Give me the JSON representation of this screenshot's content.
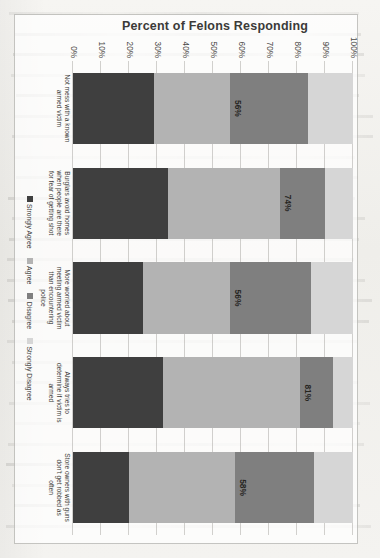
{
  "page": {
    "background_note": "scanned book page, chart rotated 90 degrees",
    "ghost_text_rows": 26
  },
  "chart_data": {
    "type": "bar",
    "subtype": "stacked-bar-100",
    "orientation": "vertical-in-chart-space-rotated-90",
    "title": "",
    "xlabel": "",
    "ylabel": "Percent of Felons Responding",
    "ylim": [
      0,
      100
    ],
    "ytick_values": [
      0,
      10,
      20,
      30,
      40,
      50,
      60,
      70,
      80,
      90,
      100
    ],
    "ytick_labels": [
      "0%",
      "10%",
      "20%",
      "30%",
      "40%",
      "50%",
      "60%",
      "70%",
      "80%",
      "90%",
      "100%"
    ],
    "grid": true,
    "legend_position": "bottom",
    "categories": [
      "Not mess with a known armed victim",
      "Burglars avoid homes when people are there for fear of getting shot",
      "More worried about meeting armed victim than encountering police",
      "Always tries to determine if victim is armed",
      "Store owners with guns don't get robbed as often"
    ],
    "series": [
      {
        "name": "Strongly Agree",
        "color": "#3f3f3f",
        "values": [
          29,
          34,
          25,
          32,
          20
        ]
      },
      {
        "name": "Agree",
        "color": "#b3b3b3",
        "values": [
          27,
          40,
          31,
          49,
          38
        ]
      },
      {
        "name": "Disagree",
        "color": "#7f7f7f",
        "values": [
          28,
          16,
          29,
          12,
          28
        ]
      },
      {
        "name": "Strongly Disagree",
        "color": "#d6d6d6",
        "values": [
          16,
          10,
          15,
          7,
          14
        ]
      }
    ],
    "annotations": [
      {
        "category": "Not mess with a known armed victim",
        "label": "56%",
        "value": 56
      },
      {
        "category": "Burglars avoid homes when people are there for fear of getting shot",
        "label": "74%",
        "value": 74
      },
      {
        "category": "More worried about meeting armed victim than encountering police",
        "label": "56%",
        "value": 56
      },
      {
        "category": "Always tries to determine if victim is armed",
        "label": "81%",
        "value": 81
      },
      {
        "category": "Store owners with guns don't get robbed as often",
        "label": "58%",
        "value": 58
      }
    ]
  },
  "colors": {
    "page": "#f2f1ee",
    "plot_bg": "#ffffff",
    "gridline": "#8c8a84",
    "text": "#3d3c39"
  }
}
